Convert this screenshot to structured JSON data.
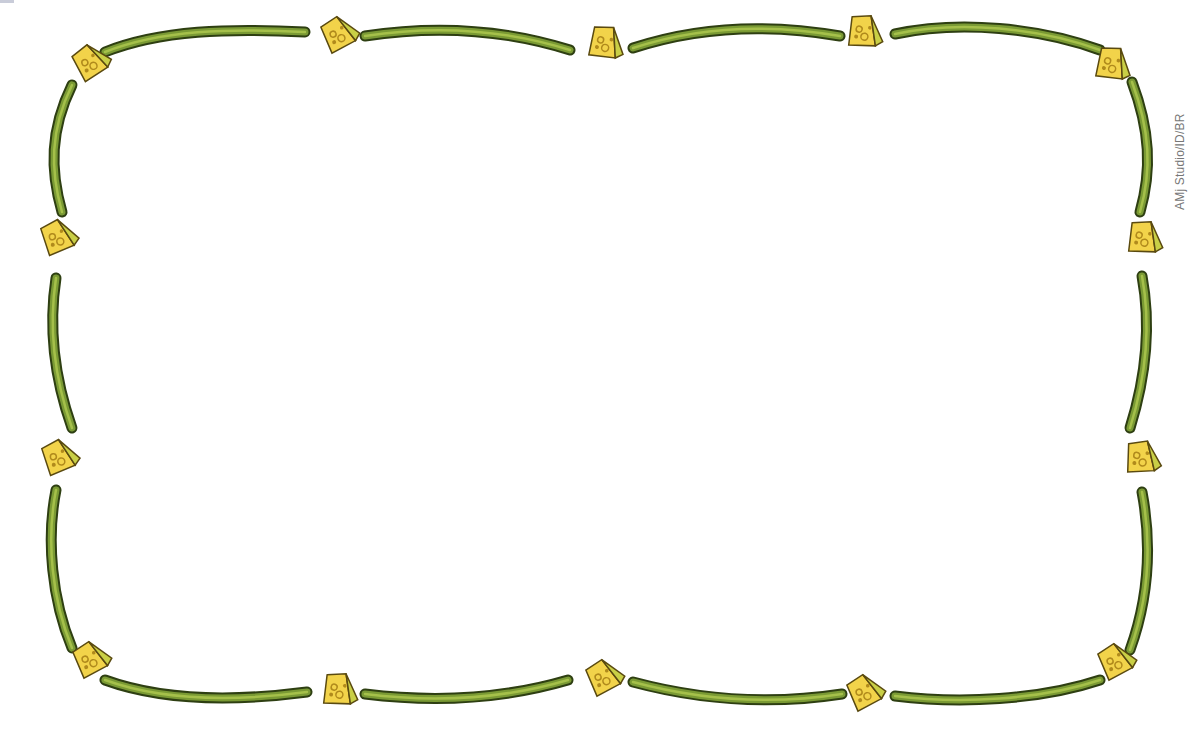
{
  "image": {
    "description": "Decorative rectangular border of green vine segments separated by yellow cheese wedges, white empty interior",
    "colors": {
      "background": "#ffffff",
      "vine_fill": "#7a9a34",
      "vine_light": "#a5c04a",
      "vine_outline": "#2e3f12",
      "cheese_face": "#f2d34a",
      "cheese_side": "#c9cf46",
      "cheese_outline": "#5a4a10",
      "cheese_hole": "#b08a1c"
    }
  },
  "credit": {
    "text": "AMj Studio/ID/BR"
  },
  "cheeses": [
    {
      "x": 90,
      "y": 65,
      "rot": -20
    },
    {
      "x": 338,
      "y": 37,
      "rot": -15
    },
    {
      "x": 603,
      "y": 45,
      "rot": 20
    },
    {
      "x": 862,
      "y": 34,
      "rot": 15
    },
    {
      "x": 1110,
      "y": 66,
      "rot": 20
    },
    {
      "x": 57,
      "y": 240,
      "rot": -10
    },
    {
      "x": 1142,
      "y": 240,
      "rot": 15
    },
    {
      "x": 58,
      "y": 460,
      "rot": -10
    },
    {
      "x": 1140,
      "y": 460,
      "rot": 10
    },
    {
      "x": 90,
      "y": 662,
      "rot": -15
    },
    {
      "x": 337,
      "y": 692,
      "rot": 15
    },
    {
      "x": 603,
      "y": 680,
      "rot": -15
    },
    {
      "x": 864,
      "y": 695,
      "rot": -15
    },
    {
      "x": 1115,
      "y": 664,
      "rot": -15
    }
  ],
  "vines": [
    {
      "d": "M105,52 C160,30 230,28 305,32"
    },
    {
      "d": "M365,36 C430,26 500,28 570,50"
    },
    {
      "d": "M633,48 C700,26 770,24 840,36"
    },
    {
      "d": "M895,34 C960,20 1040,28 1100,50"
    },
    {
      "d": "M72,85 C50,130 50,170 62,212"
    },
    {
      "d": "M56,278 C48,330 55,380 72,428"
    },
    {
      "d": "M56,490 C46,540 52,600 72,648"
    },
    {
      "d": "M1132,82 C1150,130 1152,170 1140,212"
    },
    {
      "d": "M1142,276 C1152,330 1145,380 1130,428"
    },
    {
      "d": "M1142,492 C1152,545 1148,600 1130,650"
    },
    {
      "d": "M105,680 C160,700 230,702 307,692"
    },
    {
      "d": "M365,694 C430,702 500,700 568,680"
    },
    {
      "d": "M633,682 C700,700 770,705 842,694"
    },
    {
      "d": "M895,696 C960,704 1040,700 1100,680"
    }
  ]
}
